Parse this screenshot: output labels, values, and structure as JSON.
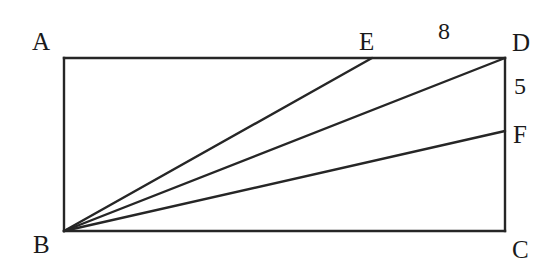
{
  "figure": {
    "type": "geometry-diagram",
    "shape": "rectangle-with-cevians",
    "background_color": "#ffffff",
    "stroke_color": "#262626",
    "stroke_width": 2.4,
    "canvas": {
      "width": 555,
      "height": 276
    }
  },
  "points": {
    "A": {
      "label": "A",
      "x": 64,
      "y": 58,
      "label_x": 32,
      "label_y": 29
    },
    "B": {
      "label": "B",
      "x": 64,
      "y": 231,
      "label_x": 33,
      "label_y": 232
    },
    "C": {
      "label": "C",
      "x": 505,
      "y": 231,
      "label_x": 512,
      "label_y": 237
    },
    "D": {
      "label": "D",
      "x": 505,
      "y": 58,
      "label_x": 512,
      "label_y": 30
    },
    "E": {
      "label": "E",
      "x": 372,
      "y": 58,
      "label_x": 359,
      "label_y": 29
    },
    "F": {
      "label": "F",
      "x": 505,
      "y": 131,
      "label_x": 513,
      "label_y": 122
    }
  },
  "edges": [
    {
      "name": "side-AD",
      "from": "A",
      "to": "D"
    },
    {
      "name": "side-DC",
      "from": "D",
      "to": "C"
    },
    {
      "name": "side-CB",
      "from": "C",
      "to": "B"
    },
    {
      "name": "side-BA",
      "from": "B",
      "to": "A"
    },
    {
      "name": "segment-BE",
      "from": "B",
      "to": "E"
    },
    {
      "name": "segment-BD",
      "from": "B",
      "to": "D"
    },
    {
      "name": "segment-BF",
      "from": "B",
      "to": "F"
    }
  ],
  "measurements": {
    "ed_length": {
      "value": "8",
      "x": 438,
      "y": 19,
      "describes": "segment ED on top side"
    },
    "df_length": {
      "value": "5",
      "x": 514,
      "y": 74,
      "describes": "segment DF on right side"
    }
  }
}
